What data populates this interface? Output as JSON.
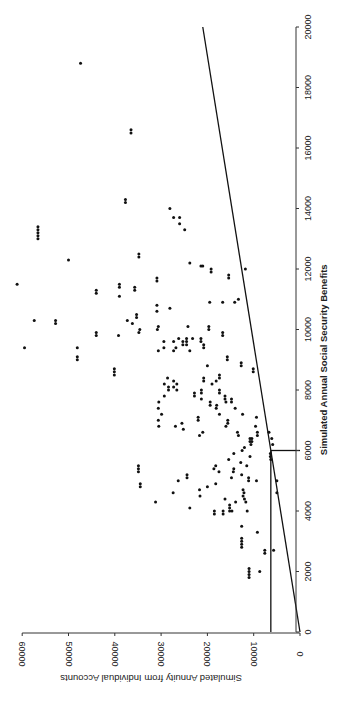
{
  "chart_data": {
    "type": "scatter",
    "orientation": "rotated-90-ccw",
    "title": "",
    "xlabel": "Simulated Annual Social Security Benefits",
    "ylabel": "Simulated Annuity from Individual Accounts",
    "xlim": [
      0,
      20000
    ],
    "ylim": [
      0,
      60000
    ],
    "x_ticks": [
      0,
      2000,
      4000,
      6000,
      8000,
      10000,
      12000,
      14000,
      16000,
      18000,
      20000
    ],
    "y_ticks": [
      0,
      10000,
      20000,
      30000,
      40000,
      50000,
      60000
    ],
    "grid": false,
    "legend": null,
    "reference_lines": [
      {
        "name": "diagonal-line",
        "points": [
          [
            0,
            0
          ],
          [
            20000,
            21000
          ]
        ]
      },
      {
        "name": "floor-horizontal-line",
        "points": [
          [
            0,
            6300
          ],
          [
            6000,
            6300
          ]
        ]
      },
      {
        "name": "floor-vertical-segment",
        "points": [
          [
            6000,
            6300
          ],
          [
            6000,
            0
          ]
        ]
      }
    ],
    "series": [
      {
        "name": "simulated workers",
        "points": [
          [
            18800,
            47400
          ],
          [
            16600,
            36500
          ],
          [
            16500,
            36500
          ],
          [
            14300,
            37700
          ],
          [
            14200,
            37700
          ],
          [
            14000,
            28100
          ],
          [
            13700,
            27300
          ],
          [
            13700,
            26000
          ],
          [
            13500,
            26000
          ],
          [
            13300,
            24900
          ],
          [
            13400,
            56600
          ],
          [
            13300,
            56600
          ],
          [
            13200,
            56600
          ],
          [
            13100,
            56600
          ],
          [
            13000,
            56600
          ],
          [
            12500,
            34800
          ],
          [
            12400,
            34800
          ],
          [
            12300,
            50000
          ],
          [
            12200,
            23800
          ],
          [
            12100,
            21400
          ],
          [
            12100,
            21000
          ],
          [
            12000,
            11800
          ],
          [
            12000,
            19200
          ],
          [
            11900,
            19200
          ],
          [
            11800,
            15400
          ],
          [
            11700,
            15400
          ],
          [
            11500,
            61100
          ],
          [
            11500,
            39000
          ],
          [
            11400,
            39000
          ],
          [
            11300,
            35700
          ],
          [
            11400,
            35700
          ],
          [
            11300,
            44000
          ],
          [
            11200,
            44000
          ],
          [
            11100,
            39000
          ],
          [
            11700,
            30900
          ],
          [
            11600,
            30900
          ],
          [
            11000,
            13300
          ],
          [
            10900,
            14100
          ],
          [
            10500,
            35300
          ],
          [
            10400,
            35300
          ],
          [
            10300,
            37300
          ],
          [
            10200,
            36200
          ],
          [
            10100,
            24200
          ],
          [
            10000,
            30800
          ],
          [
            10100,
            30600
          ],
          [
            10000,
            34600
          ],
          [
            9900,
            34800
          ],
          [
            9800,
            39200
          ],
          [
            9700,
            23200
          ],
          [
            9600,
            27300
          ],
          [
            10700,
            28100
          ],
          [
            10800,
            30900
          ],
          [
            10600,
            30900
          ],
          [
            10900,
            19500
          ],
          [
            10900,
            16700
          ],
          [
            10300,
            57400
          ],
          [
            10300,
            52800
          ],
          [
            10200,
            52800
          ],
          [
            9900,
            44000
          ],
          [
            9800,
            44000
          ],
          [
            9400,
            59500
          ],
          [
            9400,
            48100
          ],
          [
            9300,
            30600
          ],
          [
            9100,
            48100
          ],
          [
            9000,
            48100
          ],
          [
            9700,
            26200
          ],
          [
            9600,
            25300
          ],
          [
            9500,
            25300
          ],
          [
            9400,
            26800
          ],
          [
            9300,
            27300
          ],
          [
            9700,
            24500
          ],
          [
            9600,
            24500
          ],
          [
            9500,
            24500
          ],
          [
            9600,
            29400
          ],
          [
            9400,
            29400
          ],
          [
            9300,
            23800
          ],
          [
            9700,
            21400
          ],
          [
            9600,
            21400
          ],
          [
            9500,
            20800
          ],
          [
            9400,
            20800
          ],
          [
            9900,
            16700
          ],
          [
            9800,
            16700
          ],
          [
            9100,
            15700
          ],
          [
            9000,
            15700
          ],
          [
            10100,
            19700
          ],
          [
            10000,
            19700
          ],
          [
            8700,
            40100
          ],
          [
            8600,
            40100
          ],
          [
            8500,
            40100
          ],
          [
            8400,
            28600
          ],
          [
            8300,
            27300
          ],
          [
            8200,
            26600
          ],
          [
            8100,
            27300
          ],
          [
            8000,
            26600
          ],
          [
            8200,
            29300
          ],
          [
            8100,
            28400
          ],
          [
            8000,
            28400
          ],
          [
            7800,
            29300
          ],
          [
            7600,
            30500
          ],
          [
            7400,
            30600
          ],
          [
            7200,
            29900
          ],
          [
            7000,
            30600
          ],
          [
            6800,
            30500
          ],
          [
            7900,
            22800
          ],
          [
            7800,
            22800
          ],
          [
            8000,
            21300
          ],
          [
            7900,
            21300
          ],
          [
            7700,
            21300
          ],
          [
            7600,
            19400
          ],
          [
            7500,
            19400
          ],
          [
            8400,
            20800
          ],
          [
            8300,
            20800
          ],
          [
            8800,
            20000
          ],
          [
            8500,
            17400
          ],
          [
            8400,
            17400
          ],
          [
            8300,
            18100
          ],
          [
            8200,
            19000
          ],
          [
            8000,
            17400
          ],
          [
            7900,
            17400
          ],
          [
            7800,
            16200
          ],
          [
            7700,
            16200
          ],
          [
            7600,
            16000
          ],
          [
            7500,
            18000
          ],
          [
            7400,
            18100
          ],
          [
            7200,
            17400
          ],
          [
            7100,
            22000
          ],
          [
            7000,
            22000
          ],
          [
            6900,
            25500
          ],
          [
            6800,
            26900
          ],
          [
            6700,
            25200
          ],
          [
            6600,
            21000
          ],
          [
            6500,
            21700
          ],
          [
            8900,
            12700
          ],
          [
            8800,
            12700
          ],
          [
            7700,
            14800
          ],
          [
            7600,
            14800
          ],
          [
            7400,
            14000
          ],
          [
            7200,
            12400
          ],
          [
            7000,
            15600
          ],
          [
            6900,
            15600
          ],
          [
            6800,
            16000
          ],
          [
            6600,
            13500
          ],
          [
            6500,
            13300
          ],
          [
            6400,
            10400
          ],
          [
            6300,
            10400
          ],
          [
            8700,
            10100
          ],
          [
            8600,
            10100
          ],
          [
            7100,
            9400
          ],
          [
            6800,
            9600
          ],
          [
            6600,
            9200
          ],
          [
            6500,
            9200
          ],
          [
            6400,
            10800
          ],
          [
            6300,
            10800
          ],
          [
            6200,
            10600
          ],
          [
            6100,
            12000
          ],
          [
            6600,
            6700
          ],
          [
            6400,
            6100
          ],
          [
            6200,
            5900
          ],
          [
            6000,
            12500
          ],
          [
            5900,
            14300
          ],
          [
            5800,
            10800
          ],
          [
            5700,
            15400
          ],
          [
            5600,
            12800
          ],
          [
            5500,
            11500
          ],
          [
            5400,
            14300
          ],
          [
            5300,
            14400
          ],
          [
            5200,
            12600
          ],
          [
            5100,
            14800
          ],
          [
            5000,
            9400
          ],
          [
            5900,
            6400
          ],
          [
            5800,
            6400
          ],
          [
            5700,
            6300
          ],
          [
            5500,
            34900
          ],
          [
            5400,
            34900
          ],
          [
            5300,
            34900
          ],
          [
            5200,
            24400
          ],
          [
            5100,
            24400
          ],
          [
            5000,
            26300
          ],
          [
            4900,
            18200
          ],
          [
            4800,
            20000
          ],
          [
            4700,
            21700
          ],
          [
            4600,
            27400
          ],
          [
            4500,
            21600
          ],
          [
            4400,
            16200
          ],
          [
            4300,
            13900
          ],
          [
            5500,
            18200
          ],
          [
            5400,
            18600
          ],
          [
            5300,
            17500
          ],
          [
            5100,
            11100
          ],
          [
            5000,
            11100
          ],
          [
            4900,
            34500
          ],
          [
            4800,
            34500
          ],
          [
            4700,
            12300
          ],
          [
            4600,
            12100
          ],
          [
            4500,
            12300
          ],
          [
            4400,
            12000
          ],
          [
            4300,
            11700
          ],
          [
            4200,
            15200
          ],
          [
            4100,
            15200
          ],
          [
            4000,
            15200
          ],
          [
            5000,
            5000
          ],
          [
            4600,
            5000
          ],
          [
            4300,
            31200
          ],
          [
            4100,
            23800
          ],
          [
            4000,
            18500
          ],
          [
            3900,
            18500
          ],
          [
            4000,
            16600
          ],
          [
            3900,
            16600
          ],
          [
            4000,
            14700
          ],
          [
            4000,
            11400
          ],
          [
            3500,
            12600
          ],
          [
            3100,
            12600
          ],
          [
            3000,
            12600
          ],
          [
            2900,
            12600
          ],
          [
            2800,
            12600
          ],
          [
            3300,
            9200
          ],
          [
            2700,
            7600
          ],
          [
            2600,
            7600
          ],
          [
            2700,
            5700
          ],
          [
            2100,
            11000
          ],
          [
            2000,
            11000
          ],
          [
            1900,
            11000
          ],
          [
            1800,
            11000
          ],
          [
            2000,
            8700
          ]
        ]
      }
    ]
  },
  "axes": {
    "xlabel": "Simulated Annual Social Security Benefits",
    "ylabel": "Simulated Annuity from Individual Accounts",
    "x_tick_labels": [
      "0",
      "2000",
      "4000",
      "6000",
      "8000",
      "10000",
      "12000",
      "14000",
      "16000",
      "18000",
      "20000"
    ],
    "y_tick_labels": [
      "0",
      "10000",
      "20000",
      "30000",
      "40000",
      "50000",
      "60000"
    ]
  }
}
